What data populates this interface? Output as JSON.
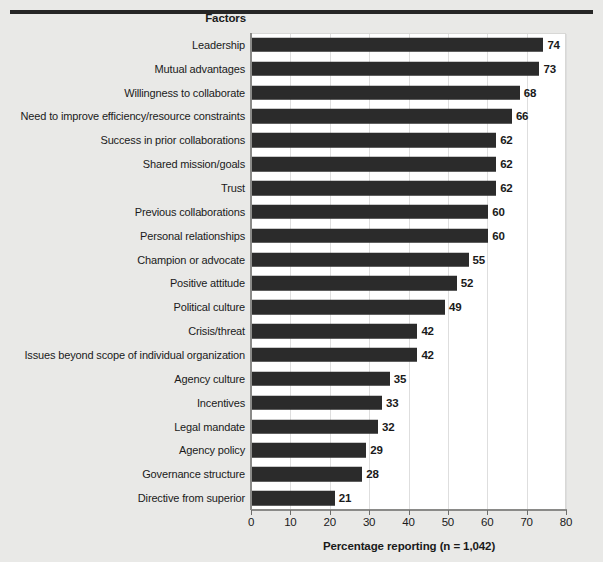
{
  "header": {
    "factors_label": "Factors"
  },
  "chart_data": {
    "type": "bar",
    "orientation": "horizontal",
    "title": "",
    "xlabel": "Percentage reporting (n = 1,042)",
    "ylabel": "Factors",
    "xlim": [
      0,
      80
    ],
    "xticks": [
      0,
      10,
      20,
      30,
      40,
      50,
      60,
      70,
      80
    ],
    "xtick_labels": [
      "0",
      "10",
      "20",
      "30",
      "40",
      "50",
      "60",
      "70",
      "80"
    ],
    "grid": true,
    "legend": false,
    "bar_color": "#2b2b2b",
    "plot_background": "#ffffff",
    "figure_background": "#e9e9e7",
    "categories": [
      "Leadership",
      "Mutual advantages",
      "Willingness to collaborate",
      "Need to improve efficiency/resource constraints",
      "Success in prior collaborations",
      "Shared mission/goals",
      "Trust",
      "Previous collaborations",
      "Personal relationships",
      "Champion or advocate",
      "Positive attitude",
      "Political culture",
      "Crisis/threat",
      "Issues beyond scope of individual organization",
      "Agency culture",
      "Incentives",
      "Legal mandate",
      "Agency policy",
      "Governance structure",
      "Directive from superior"
    ],
    "values": [
      74,
      73,
      68,
      66,
      62,
      62,
      62,
      60,
      60,
      55,
      52,
      49,
      42,
      42,
      35,
      33,
      32,
      29,
      28,
      21
    ],
    "value_labels": [
      "74",
      "73",
      "68",
      "66",
      "62",
      "62",
      "62",
      "60",
      "60",
      "55",
      "52",
      "49",
      "42",
      "42",
      "35",
      "33",
      "32",
      "29",
      "28",
      "21"
    ]
  }
}
